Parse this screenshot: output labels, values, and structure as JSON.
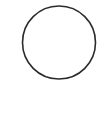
{
  "shape": {
    "type": "circle",
    "cx": 59,
    "cy": 42.5,
    "r": 36.5,
    "stroke": "#2b2b2b",
    "stroke_width": 1.6,
    "fill": "none"
  },
  "background": "#ffffff"
}
